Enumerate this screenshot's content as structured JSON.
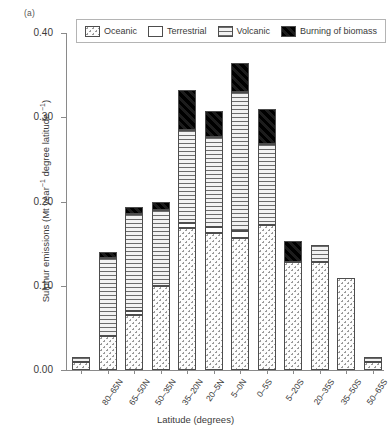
{
  "panel_label": "(a)",
  "chart_data": {
    "type": "bar",
    "subtype": "stacked-vertical",
    "title": "",
    "xlabel": "Latitude (degrees)",
    "ylabel": "Sulphur emissions (Mt year⁻¹ degree latitude⁻¹)",
    "ylabel_parts": {
      "prefix": "Sulphur emissions (Mt year",
      "sup1": "−1",
      "middle": " degree latitude ",
      "sup2": "−1",
      "suffix": ")"
    },
    "ylim": [
      0.0,
      0.4
    ],
    "ytick_values": [
      0.0,
      0.1,
      0.2,
      0.3,
      0.4
    ],
    "ytick_labels": [
      "0.00",
      "0.10",
      "0.20",
      "0.30",
      "0.40"
    ],
    "grid": false,
    "legend_position": "top-center",
    "categories": [
      "80–65N",
      "65–50N",
      "50–35N",
      "35–20N",
      "20–5N",
      "5–0N",
      "0–5S",
      "5–20S",
      "20–35S",
      "35–50S",
      "50–65S",
      "65–80S"
    ],
    "series": [
      {
        "name": "Oceanic",
        "fill": "dotted",
        "color": "#fdfdfd",
        "values": [
          0.01,
          0.04,
          0.065,
          0.1,
          0.168,
          0.163,
          0.157,
          0.172,
          0.128,
          0.128,
          0.109,
          0.01
        ]
      },
      {
        "name": "Terrestrial",
        "fill": "white",
        "color": "#ffffff",
        "values": [
          0.0,
          0.0,
          0.005,
          0.0,
          0.006,
          0.007,
          0.008,
          0.0,
          0.0,
          0.0,
          0.0,
          0.0
        ]
      },
      {
        "name": "Volcanic",
        "fill": "horizontal-lines",
        "color": "#e6e6e6",
        "values": [
          0.005,
          0.093,
          0.115,
          0.09,
          0.111,
          0.107,
          0.165,
          0.096,
          0.0,
          0.02,
          0.0,
          0.005
        ]
      },
      {
        "name": "Burning of biomass",
        "fill": "solid-black",
        "color": "#111111",
        "values": [
          0.0,
          0.007,
          0.008,
          0.01,
          0.047,
          0.031,
          0.035,
          0.042,
          0.025,
          0.0,
          0.0,
          0.0
        ]
      }
    ],
    "totals": [
      0.015,
      0.14,
      0.193,
      0.2,
      0.332,
      0.308,
      0.365,
      0.31,
      0.153,
      0.148,
      0.109,
      0.015
    ]
  }
}
